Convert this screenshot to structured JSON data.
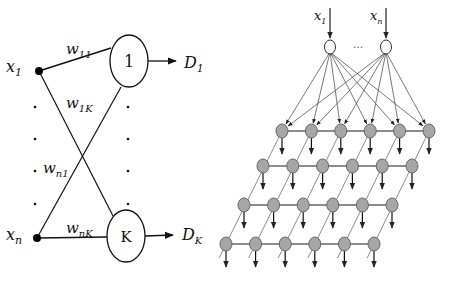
{
  "left_diagram": {
    "inputs": [
      {
        "label": "x",
        "sub": "1"
      },
      {
        "label": "x",
        "sub": "n"
      }
    ],
    "neurons": [
      {
        "label": "1"
      },
      {
        "label": "K"
      }
    ],
    "outputs": [
      {
        "label": "D",
        "sub": "1"
      },
      {
        "label": "D",
        "sub": "K"
      }
    ],
    "weights": [
      {
        "label": "w",
        "sub": "11"
      },
      {
        "label": "w",
        "sub": "1K"
      },
      {
        "label": "w",
        "sub": "n1"
      },
      {
        "label": "w",
        "sub": "nK"
      }
    ]
  },
  "right_diagram": {
    "inputs": [
      {
        "label": "x",
        "sub": "1"
      },
      {
        "label": "x",
        "sub": "n"
      }
    ],
    "ellipsis": "...",
    "grid": {
      "rows": 4,
      "cols": 6
    },
    "node_color": "#a6a6a6",
    "edge_color": "#8c8c8c"
  }
}
